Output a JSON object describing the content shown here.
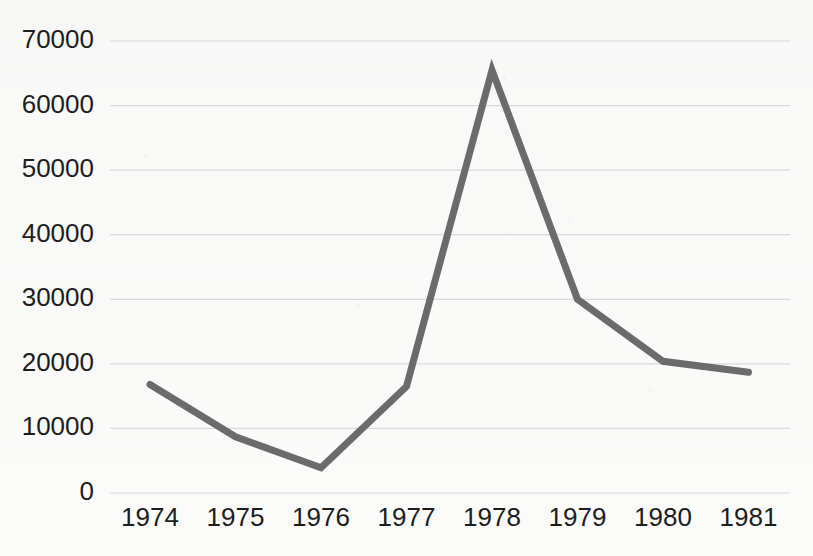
{
  "chart_data": {
    "type": "line",
    "title": "",
    "subtitle": "",
    "xlabel": "",
    "ylabel": "",
    "categories": [
      "1974",
      "1975",
      "1976",
      "1977",
      "1978",
      "1979",
      "1980",
      "1981"
    ],
    "values": [
      16800,
      8700,
      3900,
      16500,
      65500,
      30000,
      20400,
      18700
    ],
    "series": [
      {
        "name": "series-1",
        "values": [
          16800,
          8700,
          3900,
          16500,
          65500,
          30000,
          20400,
          18700
        ],
        "color": "#6b6b6b"
      }
    ],
    "ylim": [
      0,
      70000
    ],
    "y_ticks": [
      0,
      10000,
      20000,
      30000,
      40000,
      50000,
      60000,
      70000
    ],
    "y_tick_labels": [
      "0",
      "10000",
      "20000",
      "30000",
      "40000",
      "50000",
      "60000",
      "70000"
    ],
    "x_tick_labels": [
      "1974",
      "1975",
      "1976",
      "1977",
      "1978",
      "1979",
      "1980",
      "1981"
    ],
    "grid": {
      "horizontal": true,
      "vertical": false,
      "color": "#d9d9d9"
    },
    "legend": {
      "visible": false,
      "position": "none",
      "entries": []
    },
    "line": {
      "color": "#6b6b6b",
      "width_px": 7,
      "markers": false
    },
    "background_color": "#fbfbfa",
    "axis_label_color": "#1d1d1d"
  },
  "layout": {
    "plot_left_px": 110,
    "plot_right_px": 790,
    "y_zero_px": 493,
    "y_top_px": 41,
    "x_first_px": 150,
    "x_step_px": 85.5
  }
}
